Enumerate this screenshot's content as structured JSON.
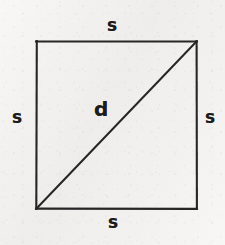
{
  "figure": {
    "type": "geometry-diagram",
    "shape": "square-with-diagonal",
    "background_color": "#f1f0ee",
    "stroke_color": "#262626",
    "label_color": "#1c1c1c",
    "labels": {
      "side_top": "s",
      "side_left": "s",
      "side_right": "s",
      "side_bottom": "s",
      "diagonal": "d"
    },
    "geometry": {
      "square": {
        "top_left": [
          36,
          41
        ],
        "top_right": [
          197,
          41
        ],
        "bottom_right": [
          197,
          209
        ],
        "bottom_left": [
          36,
          209
        ],
        "width": 161,
        "height": 168,
        "stroke_width": 2
      },
      "diagonal": {
        "from": [
          36,
          209
        ],
        "to": [
          197,
          41
        ],
        "stroke_width": 2
      }
    }
  }
}
